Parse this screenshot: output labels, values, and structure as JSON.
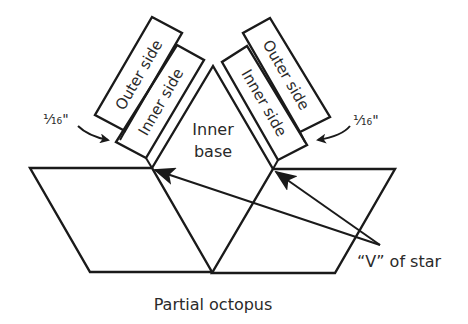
{
  "diagram": {
    "title": "Partial octopus",
    "labels": {
      "outer_side_left": "Outer side",
      "inner_side_left": "Inner side",
      "outer_side_right": "Outer side",
      "inner_side_right": "Inner side",
      "inner_base_line1": "Inner",
      "inner_base_line2": "base",
      "gap_left": "¹⁄₁₆\"",
      "gap_right": "¹⁄₁₆\"",
      "v_of_star": "“V” of star"
    },
    "colors": {
      "stroke": "#1a1a1a",
      "text": "#2a2a2a",
      "background": "#ffffff"
    }
  }
}
